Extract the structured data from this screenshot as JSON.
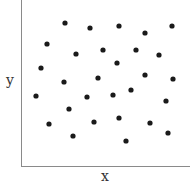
{
  "chart_data": {
    "type": "scatter",
    "title": "",
    "xlabel": "x",
    "ylabel": "y",
    "grid": false,
    "legend": null,
    "ticks": false,
    "xlim": [
      0,
      169
    ],
    "ylim": [
      0,
      166
    ],
    "points": [
      {
        "x": 44,
        "y": 143
      },
      {
        "x": 69,
        "y": 138
      },
      {
        "x": 98,
        "y": 140
      },
      {
        "x": 151,
        "y": 140
      },
      {
        "x": 124,
        "y": 133
      },
      {
        "x": 26,
        "y": 122
      },
      {
        "x": 55,
        "y": 112
      },
      {
        "x": 82,
        "y": 116
      },
      {
        "x": 115,
        "y": 116
      },
      {
        "x": 138,
        "y": 111
      },
      {
        "x": 96,
        "y": 103
      },
      {
        "x": 20,
        "y": 98
      },
      {
        "x": 43,
        "y": 84
      },
      {
        "x": 77,
        "y": 88
      },
      {
        "x": 124,
        "y": 91
      },
      {
        "x": 152,
        "y": 87
      },
      {
        "x": 15,
        "y": 70
      },
      {
        "x": 66,
        "y": 69
      },
      {
        "x": 92,
        "y": 71
      },
      {
        "x": 110,
        "y": 76
      },
      {
        "x": 145,
        "y": 65
      },
      {
        "x": 48,
        "y": 57
      },
      {
        "x": 28,
        "y": 42
      },
      {
        "x": 73,
        "y": 44
      },
      {
        "x": 98,
        "y": 48
      },
      {
        "x": 129,
        "y": 43
      },
      {
        "x": 52,
        "y": 30
      },
      {
        "x": 147,
        "y": 33
      },
      {
        "x": 105,
        "y": 25
      }
    ]
  },
  "colors": {
    "point": "#1a1a1a",
    "axis": "#8a8a8a",
    "label": "#333333"
  },
  "labels": {
    "x": "x",
    "y": "y"
  }
}
